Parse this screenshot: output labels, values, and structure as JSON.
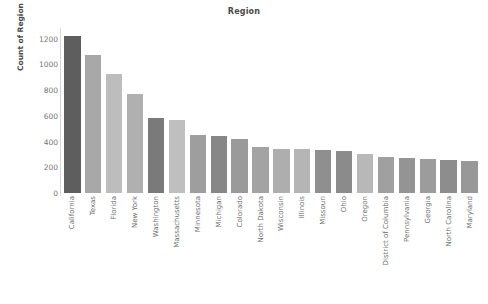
{
  "chart_data": {
    "type": "bar",
    "title": "Region",
    "xlabel": "",
    "ylabel": "Count of Region",
    "ylim": [
      0,
      1260
    ],
    "yticks": [
      0,
      200,
      400,
      600,
      800,
      1000,
      1200
    ],
    "grid": false,
    "legend": "none",
    "orientation": "vertical",
    "categories": [
      "California",
      "Texas",
      "Florida",
      "New York",
      "Washington",
      "Massachusetts",
      "Minnesota",
      "Michigan",
      "Colorado",
      "North Dakota",
      "Wisconsin",
      "Illinois",
      "Missouri",
      "Ohio",
      "Oregon",
      "District of Columbia",
      "Pennsylvania",
      "Georgia",
      "North Carolina",
      "Maryland"
    ],
    "values": [
      1220,
      1070,
      925,
      770,
      585,
      570,
      455,
      440,
      420,
      355,
      345,
      340,
      335,
      330,
      300,
      280,
      275,
      268,
      258,
      250
    ],
    "bar_colors": [
      "#5e5e5e",
      "#a8a8a8",
      "#bdbdbd",
      "#b0b0b0",
      "#7a7a7a",
      "#bfbfbf",
      "#9e9e9e",
      "#878787",
      "#9a9a9a",
      "#a3a3a3",
      "#aeaeae",
      "#b5b5b5",
      "#8f8f8f",
      "#8b8b8b",
      "#b8b8b8",
      "#a0a0a0",
      "#949494",
      "#9c9c9c",
      "#8d8d8d",
      "#989898"
    ],
    "axis_color": "#d6d6d6",
    "tick_label_color": "#757575",
    "title_color": "#4a4a4a",
    "background": "#ffffff"
  }
}
